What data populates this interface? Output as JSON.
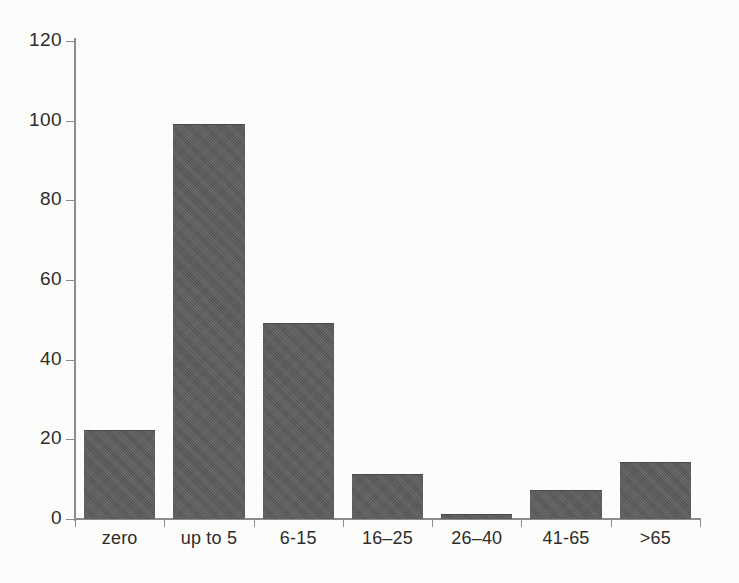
{
  "chart_data": {
    "type": "bar",
    "title": "",
    "subtitle": "",
    "xlabel": "",
    "ylabel": "",
    "categories": [
      "zero",
      "up to 5",
      "6-15",
      "16–25",
      "26–40",
      "41-65",
      ">65"
    ],
    "values": [
      22,
      99,
      49,
      11,
      1,
      7,
      14
    ],
    "series": [
      {
        "name": "count",
        "values": [
          22,
          99,
          49,
          11,
          1,
          7,
          14
        ]
      }
    ],
    "ylim": [
      0,
      120
    ],
    "yticks": [
      0,
      20,
      40,
      60,
      80,
      100,
      120
    ],
    "ytick_labels": [
      "0",
      "20",
      "40",
      "60",
      "80",
      "100",
      "120"
    ],
    "grid": false,
    "legend": false,
    "legend_position": "none",
    "bar_color": "#5b5b5b",
    "axis_color": "#8c8c8c",
    "text_color": "#2d2d2d",
    "background_color": "#fdfdfb"
  },
  "axes": {
    "y": {
      "ticks": [
        {
          "label": "120",
          "value": 120
        },
        {
          "label": "100",
          "value": 100
        },
        {
          "label": "80",
          "value": 80
        },
        {
          "label": "60",
          "value": 60
        },
        {
          "label": "40",
          "value": 40
        },
        {
          "label": "20",
          "value": 20
        },
        {
          "label": "0",
          "value": 0
        }
      ]
    },
    "x": {
      "ticks": [
        {
          "label": "zero"
        },
        {
          "label": "up to 5"
        },
        {
          "label": "6-15"
        },
        {
          "label": "16–25"
        },
        {
          "label": "26–40"
        },
        {
          "label": "41-65"
        },
        {
          "label": ">65"
        }
      ]
    }
  }
}
